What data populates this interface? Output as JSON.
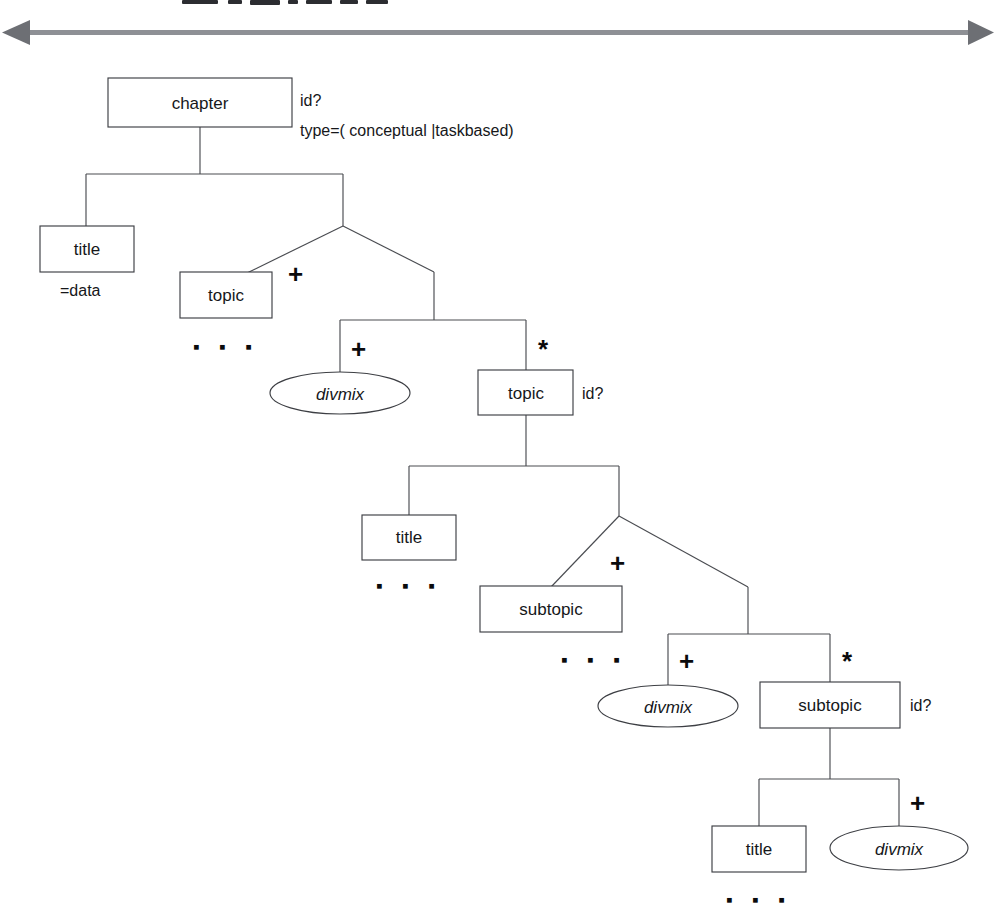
{
  "figure": {
    "kind": "dtd-content-model-tree",
    "divider": {
      "name": "horizontal-double-arrow-rule",
      "left_arrow": "◀",
      "right_arrow": "▶"
    }
  },
  "nodes": {
    "chapter": {
      "label": "chapter",
      "shape": "box"
    },
    "title_1": {
      "label": "title",
      "shape": "box"
    },
    "topic_1": {
      "label": "topic",
      "shape": "box"
    },
    "divmix_1": {
      "label": "divmix",
      "shape": "ellipse"
    },
    "topic_2": {
      "label": "topic",
      "shape": "box"
    },
    "title_2": {
      "label": "title",
      "shape": "box"
    },
    "subtopic_1": {
      "label": "subtopic",
      "shape": "box"
    },
    "divmix_2": {
      "label": "divmix",
      "shape": "ellipse"
    },
    "subtopic_2": {
      "label": "subtopic",
      "shape": "box"
    },
    "title_3": {
      "label": "title",
      "shape": "box"
    },
    "divmix_3": {
      "label": "divmix",
      "shape": "ellipse"
    }
  },
  "annotations": {
    "chapter_id": "id?",
    "chapter_type": "type=( conceptual |taskbased)",
    "title_data": "=data",
    "topic_2_id": "id?",
    "subtopic_2_id": "id?"
  },
  "multiplicities": {
    "topic_1": "+",
    "divmix_1": "+",
    "topic_2": "*",
    "subtopic_1": "+",
    "divmix_2": "+",
    "subtopic_2": "*",
    "divmix_3": "+"
  },
  "ellipsis": {
    "glyph": "▪",
    "after_topic_1": "▪ ▪ ▪",
    "after_title_2": "▪ ▪ ▪",
    "after_subtopic_1": "▪ ▪ ▪",
    "after_title_3": "▪ ▪ ▪"
  },
  "colors": {
    "stroke": "#3d3f44",
    "text": "#16171a",
    "rule": "#8e9095",
    "background": "#ffffff"
  }
}
